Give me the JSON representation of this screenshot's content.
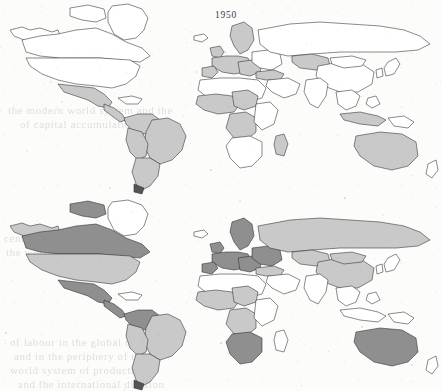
{
  "figure": {
    "kind": "choropleth-world-map-pair",
    "panels": [
      {
        "id": "panel-1950",
        "year_label": "1950"
      },
      {
        "id": "panel-2010",
        "year_label": "2010"
      }
    ]
  },
  "legend_shades": {
    "none": "#ffffff",
    "light": "#c9c9c9",
    "dark": "#8f8f8f",
    "outline": "#2b2b2b"
  },
  "bleed_text": [
    {
      "text": "the modern world system and the",
      "x": 8,
      "y": 104
    },
    {
      "text": "of capital accumulation in the",
      "x": 20,
      "y": 118
    },
    {
      "text": "century",
      "x": 4,
      "y": 232
    },
    {
      "text": "the  world  economy  and  the",
      "x": 6,
      "y": 246
    },
    {
      "text": "of  labour  in  the  global  north",
      "x": 10,
      "y": 336
    },
    {
      "text": "and  in  the  periphery  of  the",
      "x": 14,
      "y": 350
    },
    {
      "text": "world  system  of  production",
      "x": 10,
      "y": 364
    },
    {
      "text": "and  the  international  division",
      "x": 18,
      "y": 378
    }
  ],
  "chart_data": {
    "type": "heatmap",
    "title": "",
    "subtitle": "",
    "xlabel": "",
    "ylabel": "",
    "legend_position": "none",
    "grid": false,
    "maps": [
      {
        "year": "1950",
        "shade_scale": [
          "none",
          "light",
          "dark"
        ],
        "regions": [
          {
            "name": "Canada",
            "shade": "none"
          },
          {
            "name": "United States",
            "shade": "none"
          },
          {
            "name": "Greenland",
            "shade": "none"
          },
          {
            "name": "Mexico",
            "shade": "light"
          },
          {
            "name": "Central America",
            "shade": "light"
          },
          {
            "name": "Brazil",
            "shade": "light"
          },
          {
            "name": "Argentina",
            "shade": "light"
          },
          {
            "name": "Chile",
            "shade": "light"
          },
          {
            "name": "Peru",
            "shade": "light"
          },
          {
            "name": "Colombia",
            "shade": "light"
          },
          {
            "name": "Venezuela",
            "shade": "light"
          },
          {
            "name": "Bolivia",
            "shade": "light"
          },
          {
            "name": "Western Europe",
            "shade": "light"
          },
          {
            "name": "Scandinavia",
            "shade": "light"
          },
          {
            "name": "Turkey",
            "shade": "light"
          },
          {
            "name": "West Africa",
            "shade": "light"
          },
          {
            "name": "Central Africa",
            "shade": "light"
          },
          {
            "name": "Kazakhstan",
            "shade": "light"
          },
          {
            "name": "Australia",
            "shade": "light"
          },
          {
            "name": "Russia",
            "shade": "none"
          },
          {
            "name": "China",
            "shade": "none"
          },
          {
            "name": "India",
            "shade": "none"
          },
          {
            "name": "Southeast Asia",
            "shade": "none"
          },
          {
            "name": "Southern Africa",
            "shade": "none"
          }
        ]
      },
      {
        "year": "2010",
        "shade_scale": [
          "none",
          "light",
          "dark"
        ],
        "regions": [
          {
            "name": "Canada",
            "shade": "dark"
          },
          {
            "name": "United States",
            "shade": "light"
          },
          {
            "name": "Greenland",
            "shade": "none"
          },
          {
            "name": "Mexico",
            "shade": "dark"
          },
          {
            "name": "Central America",
            "shade": "dark"
          },
          {
            "name": "Venezuela",
            "shade": "dark"
          },
          {
            "name": "Colombia",
            "shade": "dark"
          },
          {
            "name": "Brazil",
            "shade": "light"
          },
          {
            "name": "Argentina",
            "shade": "light"
          },
          {
            "name": "Chile",
            "shade": "light"
          },
          {
            "name": "Peru",
            "shade": "light"
          },
          {
            "name": "Bolivia",
            "shade": "light"
          },
          {
            "name": "Western Europe",
            "shade": "dark"
          },
          {
            "name": "Scandinavia",
            "shade": "dark"
          },
          {
            "name": "Eastern Europe",
            "shade": "dark"
          },
          {
            "name": "Russia",
            "shade": "light"
          },
          {
            "name": "Kazakhstan",
            "shade": "light"
          },
          {
            "name": "China",
            "shade": "light"
          },
          {
            "name": "Mongolia",
            "shade": "light"
          },
          {
            "name": "West Africa",
            "shade": "light"
          },
          {
            "name": "Central Africa",
            "shade": "light"
          },
          {
            "name": "South Africa",
            "shade": "dark"
          },
          {
            "name": "Australia",
            "shade": "dark"
          },
          {
            "name": "India",
            "shade": "none"
          },
          {
            "name": "Southeast Asia",
            "shade": "none"
          }
        ]
      }
    ]
  }
}
